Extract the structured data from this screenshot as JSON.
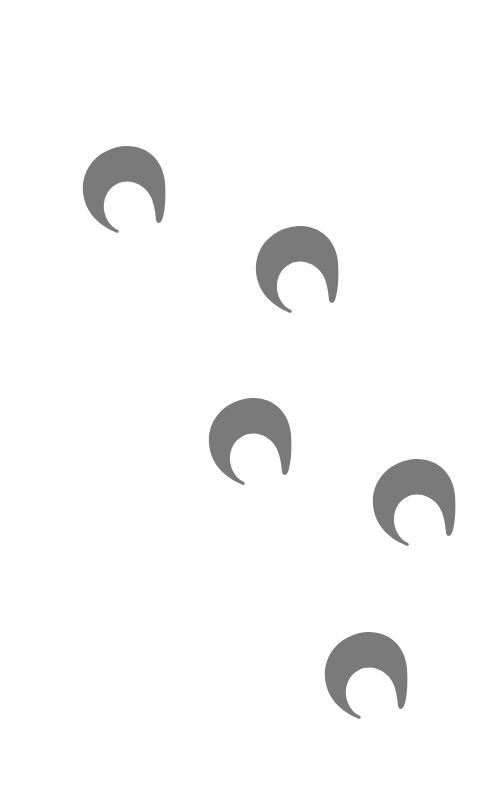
{
  "canvas": {
    "width": 502,
    "height": 802,
    "background": "#ffffff"
  },
  "shape_color": "#7a7a7a",
  "shapes": [
    {
      "name": "crescent-1",
      "x": 81,
      "y": 144
    },
    {
      "name": "crescent-2",
      "x": 254,
      "y": 224
    },
    {
      "name": "crescent-3",
      "x": 207,
      "y": 396
    },
    {
      "name": "crescent-4",
      "x": 371,
      "y": 457
    },
    {
      "name": "crescent-5",
      "x": 323,
      "y": 630
    }
  ]
}
